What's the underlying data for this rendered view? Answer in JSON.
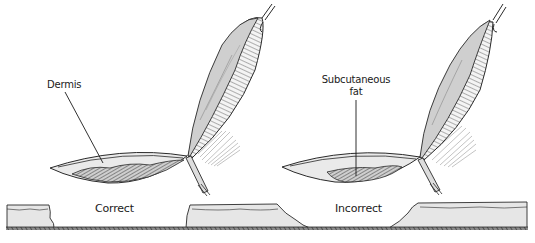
{
  "figure": {
    "type": "surgical-illustration",
    "panels": [
      {
        "id": "correct",
        "caption": "Correct",
        "callout": {
          "text_lines": [
            "Dermis"
          ]
        }
      },
      {
        "id": "incorrect",
        "caption": "Incorrect",
        "callout": {
          "text_lines": [
            "Subcutaneous",
            "fat"
          ]
        }
      }
    ]
  },
  "colors": {
    "line": "#2a2a2a",
    "tissue_fill": "#e6e6e6",
    "tissue_dark": "#b8b8b8",
    "background": "#ffffff"
  }
}
